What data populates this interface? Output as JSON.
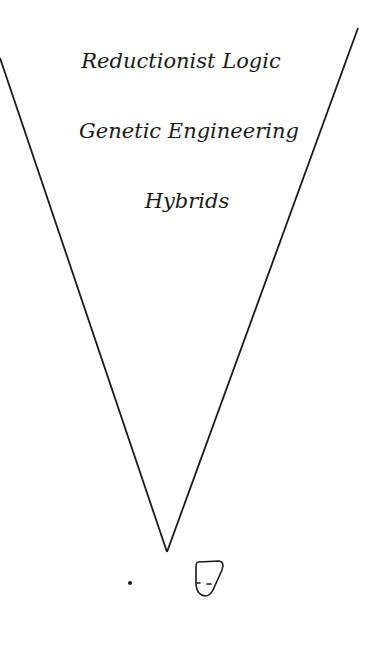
{
  "diagram": {
    "type": "inverted-funnel",
    "labels": [
      "Reductionist Logic",
      "Genetic Engineering",
      "Hybrids"
    ],
    "line_color": "#1a1a1a",
    "background": "#ffffff",
    "bottom_figures": [
      "dot",
      "small-head-sketch"
    ]
  }
}
